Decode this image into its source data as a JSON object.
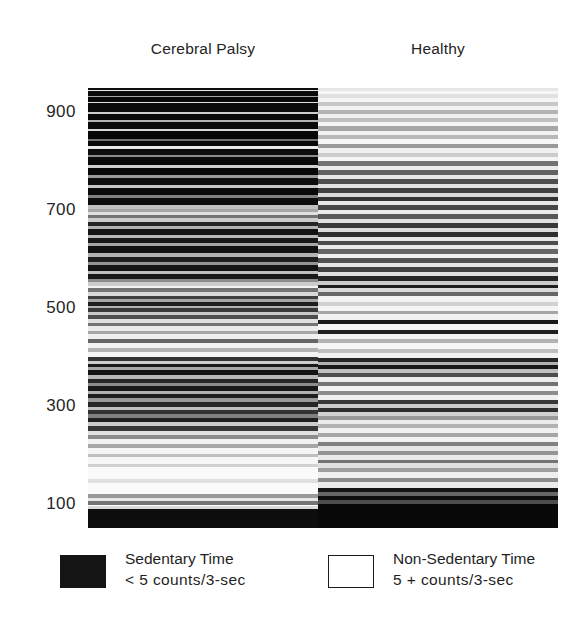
{
  "figure": {
    "title": "",
    "columns": [
      {
        "id": "cerebral-palsy",
        "label": "Cerebral Palsy"
      },
      {
        "id": "healthy",
        "label": "Healthy"
      }
    ],
    "legend": [
      {
        "id": "sedentary",
        "swatch": "filled-black",
        "line1": "Sedentary Time",
        "line2": "< 5 counts/3-sec",
        "color": "#141414"
      },
      {
        "id": "non-sedentary",
        "swatch": "empty-outline",
        "line1": "Non-Sedentary Time",
        "line2": "5 + counts/3-sec",
        "color": "#ffffff"
      }
    ]
  },
  "chart_data": {
    "type": "heatmap",
    "title": "",
    "xlabel": "",
    "ylabel": "",
    "categories": [
      "Cerebral Palsy",
      "Healthy"
    ],
    "ytick_labels": [
      "900",
      "700",
      "500",
      "300",
      "100"
    ],
    "ytick_values": [
      900,
      700,
      500,
      300,
      100
    ],
    "ylim": [
      50,
      950
    ],
    "grid": false,
    "legend_position": "bottom",
    "colorscale": {
      "sedentary": "#141414",
      "non_sedentary": "#ffffff"
    },
    "series": [
      {
        "name": "Cerebral Palsy",
        "bands": [
          [
            950,
            946,
            0.95
          ],
          [
            946,
            943,
            0.1
          ],
          [
            943,
            934,
            0.96
          ],
          [
            934,
            931,
            0.35
          ],
          [
            931,
            922,
            0.97
          ],
          [
            922,
            919,
            0.12
          ],
          [
            919,
            900,
            0.96
          ],
          [
            900,
            896,
            0.2
          ],
          [
            896,
            884,
            0.97
          ],
          [
            884,
            880,
            0.3
          ],
          [
            880,
            866,
            0.96
          ],
          [
            866,
            862,
            0.15
          ],
          [
            862,
            845,
            0.97
          ],
          [
            845,
            841,
            0.55
          ],
          [
            841,
            832,
            0.96
          ],
          [
            832,
            826,
            0.08
          ],
          [
            826,
            812,
            0.95
          ],
          [
            812,
            808,
            0.45
          ],
          [
            808,
            792,
            0.96
          ],
          [
            792,
            787,
            0.18
          ],
          [
            787,
            772,
            0.97
          ],
          [
            772,
            766,
            0.4
          ],
          [
            766,
            752,
            0.95
          ],
          [
            752,
            746,
            0.22
          ],
          [
            746,
            731,
            0.96
          ],
          [
            731,
            724,
            0.5
          ],
          [
            724,
            710,
            0.95
          ],
          [
            710,
            702,
            0.25
          ],
          [
            702,
            697,
            0.35
          ],
          [
            697,
            690,
            0.12
          ],
          [
            690,
            684,
            0.55
          ],
          [
            684,
            676,
            0.2
          ],
          [
            676,
            668,
            0.85
          ],
          [
            668,
            662,
            0.3
          ],
          [
            662,
            650,
            0.92
          ],
          [
            650,
            644,
            0.28
          ],
          [
            644,
            632,
            0.9
          ],
          [
            632,
            626,
            0.35
          ],
          [
            626,
            612,
            0.93
          ],
          [
            612,
            605,
            0.3
          ],
          [
            605,
            594,
            0.88
          ],
          [
            594,
            588,
            0.42
          ],
          [
            588,
            576,
            0.92
          ],
          [
            576,
            570,
            0.25
          ],
          [
            570,
            559,
            0.9
          ],
          [
            559,
            553,
            0.45
          ],
          [
            553,
            546,
            0.2
          ],
          [
            546,
            540,
            0.05
          ],
          [
            540,
            532,
            0.55
          ],
          [
            532,
            525,
            0.15
          ],
          [
            525,
            518,
            0.75
          ],
          [
            518,
            512,
            0.35
          ],
          [
            512,
            505,
            0.88
          ],
          [
            505,
            499,
            0.3
          ],
          [
            499,
            492,
            0.78
          ],
          [
            492,
            485,
            0.22
          ],
          [
            485,
            478,
            0.7
          ],
          [
            478,
            470,
            0.12
          ],
          [
            470,
            464,
            0.55
          ],
          [
            464,
            452,
            0.08
          ],
          [
            452,
            446,
            0.35
          ],
          [
            446,
            436,
            0.06
          ],
          [
            436,
            428,
            0.6
          ],
          [
            428,
            418,
            0.05
          ],
          [
            418,
            410,
            0.3
          ],
          [
            410,
            399,
            0.04
          ],
          [
            399,
            392,
            0.8
          ],
          [
            392,
            386,
            0.2
          ],
          [
            386,
            379,
            0.9
          ],
          [
            379,
            373,
            0.35
          ],
          [
            373,
            362,
            0.92
          ],
          [
            362,
            355,
            0.28
          ],
          [
            355,
            346,
            0.85
          ],
          [
            346,
            340,
            0.45
          ],
          [
            340,
            331,
            0.9
          ],
          [
            331,
            324,
            0.3
          ],
          [
            324,
            315,
            0.88
          ],
          [
            315,
            308,
            0.4
          ],
          [
            308,
            298,
            0.85
          ],
          [
            298,
            292,
            0.25
          ],
          [
            292,
            283,
            0.8
          ],
          [
            283,
            276,
            0.5
          ],
          [
            276,
            266,
            0.88
          ],
          [
            266,
            259,
            0.2
          ],
          [
            259,
            249,
            0.78
          ],
          [
            249,
            241,
            0.12
          ],
          [
            241,
            233,
            0.45
          ],
          [
            233,
            222,
            0.06
          ],
          [
            222,
            214,
            0.35
          ],
          [
            214,
            202,
            0.04
          ],
          [
            202,
            196,
            0.25
          ],
          [
            196,
            180,
            0.03
          ],
          [
            180,
            174,
            0.18
          ],
          [
            174,
            150,
            0.02
          ],
          [
            150,
            143,
            0.12
          ],
          [
            143,
            120,
            0.02
          ],
          [
            120,
            112,
            0.4
          ],
          [
            112,
            106,
            0.1
          ],
          [
            106,
            96,
            0.55
          ],
          [
            96,
            88,
            0.15
          ],
          [
            88,
            50,
            0.95
          ]
        ]
      },
      {
        "name": "Healthy",
        "bands": [
          [
            950,
            944,
            0.1
          ],
          [
            944,
            938,
            0.03
          ],
          [
            938,
            930,
            0.12
          ],
          [
            930,
            922,
            0.04
          ],
          [
            922,
            914,
            0.22
          ],
          [
            914,
            906,
            0.05
          ],
          [
            906,
            897,
            0.3
          ],
          [
            897,
            889,
            0.06
          ],
          [
            889,
            880,
            0.25
          ],
          [
            880,
            872,
            0.04
          ],
          [
            872,
            863,
            0.35
          ],
          [
            863,
            854,
            0.05
          ],
          [
            854,
            845,
            0.28
          ],
          [
            845,
            836,
            0.03
          ],
          [
            836,
            827,
            0.4
          ],
          [
            827,
            818,
            0.06
          ],
          [
            818,
            809,
            0.2
          ],
          [
            809,
            800,
            0.04
          ],
          [
            800,
            790,
            0.55
          ],
          [
            790,
            782,
            0.08
          ],
          [
            782,
            772,
            0.62
          ],
          [
            772,
            764,
            0.1
          ],
          [
            764,
            754,
            0.7
          ],
          [
            754,
            746,
            0.12
          ],
          [
            746,
            736,
            0.75
          ],
          [
            736,
            728,
            0.15
          ],
          [
            728,
            718,
            0.8
          ],
          [
            718,
            710,
            0.1
          ],
          [
            710,
            700,
            0.72
          ],
          [
            700,
            692,
            0.08
          ],
          [
            692,
            682,
            0.65
          ],
          [
            682,
            674,
            0.12
          ],
          [
            674,
            664,
            0.78
          ],
          [
            664,
            656,
            0.14
          ],
          [
            656,
            646,
            0.82
          ],
          [
            646,
            638,
            0.1
          ],
          [
            638,
            628,
            0.7
          ],
          [
            628,
            620,
            0.08
          ],
          [
            620,
            610,
            0.6
          ],
          [
            610,
            602,
            0.06
          ],
          [
            602,
            592,
            0.68
          ],
          [
            592,
            584,
            0.1
          ],
          [
            584,
            574,
            0.75
          ],
          [
            574,
            566,
            0.12
          ],
          [
            566,
            556,
            0.85
          ],
          [
            556,
            548,
            0.2
          ],
          [
            548,
            540,
            0.88
          ],
          [
            540,
            532,
            0.15
          ],
          [
            532,
            524,
            0.6
          ],
          [
            524,
            512,
            0.05
          ],
          [
            512,
            504,
            0.18
          ],
          [
            504,
            494,
            0.04
          ],
          [
            494,
            487,
            0.35
          ],
          [
            487,
            476,
            0.05
          ],
          [
            476,
            468,
            0.9
          ],
          [
            468,
            455,
            0.04
          ],
          [
            455,
            447,
            0.88
          ],
          [
            447,
            436,
            0.05
          ],
          [
            436,
            428,
            0.3
          ],
          [
            428,
            416,
            0.03
          ],
          [
            416,
            408,
            0.25
          ],
          [
            408,
            398,
            0.05
          ],
          [
            398,
            390,
            0.85
          ],
          [
            390,
            383,
            0.3
          ],
          [
            383,
            375,
            0.9
          ],
          [
            375,
            367,
            0.25
          ],
          [
            367,
            358,
            0.7
          ],
          [
            358,
            348,
            0.08
          ],
          [
            348,
            340,
            0.55
          ],
          [
            340,
            330,
            0.05
          ],
          [
            330,
            322,
            0.45
          ],
          [
            322,
            312,
            0.06
          ],
          [
            312,
            304,
            0.78
          ],
          [
            304,
            296,
            0.2
          ],
          [
            296,
            288,
            0.82
          ],
          [
            288,
            280,
            0.18
          ],
          [
            280,
            271,
            0.4
          ],
          [
            271,
            262,
            0.08
          ],
          [
            262,
            254,
            0.3
          ],
          [
            254,
            244,
            0.06
          ],
          [
            244,
            236,
            0.35
          ],
          [
            236,
            226,
            0.05
          ],
          [
            226,
            218,
            0.5
          ],
          [
            218,
            208,
            0.1
          ],
          [
            208,
            200,
            0.42
          ],
          [
            200,
            190,
            0.08
          ],
          [
            190,
            182,
            0.55
          ],
          [
            182,
            172,
            0.12
          ],
          [
            172,
            164,
            0.38
          ],
          [
            164,
            152,
            0.06
          ],
          [
            152,
            144,
            0.45
          ],
          [
            144,
            132,
            0.08
          ],
          [
            132,
            124,
            0.92
          ],
          [
            124,
            116,
            0.6
          ],
          [
            116,
            108,
            0.95
          ],
          [
            108,
            100,
            0.7
          ],
          [
            100,
            50,
            0.97
          ]
        ]
      }
    ]
  }
}
